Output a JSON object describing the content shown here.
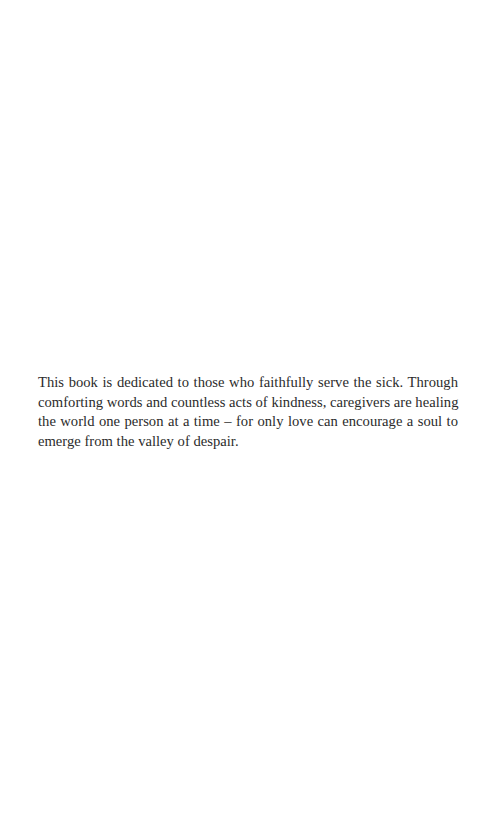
{
  "page": {
    "background": "#ffffff",
    "text_color": "#2b2b2b"
  },
  "dedication": {
    "full_text": "This book is dedicated to those who faithfully serve the sick. Through comforting words and countless acts of kindness, caregivers are healing the world one person at a time – for only love can encourage a soul to emerge from the valley of despair.",
    "lines": [
      "This book is dedicated to those who faithfully serve the sick. Through",
      "comforting words and countless acts of kindness, caregivers are healing",
      "the world one person at a time – for only love can encourage a soul to",
      "emerge from the valley of despair."
    ]
  }
}
